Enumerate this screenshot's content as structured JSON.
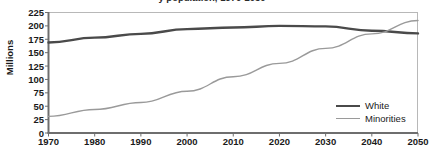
{
  "chart_data": {
    "type": "line",
    "title": "y population, 1970-2050",
    "xlabel": "",
    "ylabel": "Millions",
    "xlim": [
      1970,
      2050
    ],
    "ylim": [
      0,
      225
    ],
    "grid": false,
    "legend_position": "bottom-right",
    "x": [
      1970,
      1980,
      1990,
      2000,
      2010,
      2020,
      2030,
      2040,
      2050
    ],
    "xticklabels": [
      "1970",
      "1980",
      "1990",
      "2000",
      "2010",
      "2020",
      "2030",
      "2040",
      "2050"
    ],
    "yticks": [
      0,
      25,
      50,
      75,
      100,
      125,
      150,
      175,
      200,
      225
    ],
    "yticklabels": [
      "0",
      "25",
      "50",
      "75",
      "100",
      "125",
      "150",
      "175",
      "200",
      "225"
    ],
    "series": [
      {
        "name": "White",
        "color": "#4a4a4a",
        "linewidth": 2.4,
        "values": [
          169,
          178,
          185,
          194,
          197,
          200,
          199,
          191,
          186
        ]
      },
      {
        "name": "Minorities",
        "color": "#9a9a9a",
        "linewidth": 1.4,
        "values": [
          31,
          44,
          57,
          78,
          105,
          130,
          158,
          185,
          210
        ]
      }
    ],
    "annotations": []
  },
  "legend": {
    "items": [
      {
        "label": "White"
      },
      {
        "label": "Minorities"
      }
    ]
  },
  "colors": {
    "white_series": "#4a4a4a",
    "minorities_series": "#9a9a9a",
    "axis": "#6e6e6e",
    "frame": "#b8b8b8",
    "text": "#1a1a1a",
    "background": "#ffffff"
  }
}
